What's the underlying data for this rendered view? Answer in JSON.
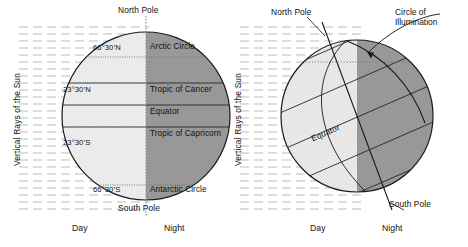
{
  "figure": {
    "colors": {
      "day_fill": "#ececec",
      "day_fill_alt": "#f2f2f2",
      "night_fill": "#9a9a9a",
      "night_fill_dark": "#8e8e8e",
      "outline": "#1a1a1a",
      "ray_dash": "#b9b9b9",
      "dotted_axis": "#8f8f8f",
      "text": "#111111"
    }
  },
  "left_panel": {
    "name": "equinox-globe",
    "axis_label": "Vertical Rays of the Sun",
    "pole_top": "North Pole",
    "pole_bottom": "South Pole",
    "latitude_left_labels": [
      {
        "text": "66°30’N",
        "lat": 66.5
      },
      {
        "text": "23°30’N",
        "lat": 23.5
      },
      {
        "text": "23°30’S",
        "lat": -23.5
      },
      {
        "text": "66°30’S",
        "lat": -66.5
      }
    ],
    "latitude_right_labels": [
      {
        "text": "Arctic Circle",
        "lat": 66.5
      },
      {
        "text": "Tropic of Cancer",
        "lat": 23.5
      },
      {
        "text": "Equator",
        "lat": 0
      },
      {
        "text": "Tropic of Capricorn",
        "lat": -23.5
      },
      {
        "text": "Antarctic Circle",
        "lat": -66.5
      }
    ],
    "bottom_left": "Day",
    "bottom_right": "Night"
  },
  "right_panel": {
    "name": "solstice-globe",
    "axis_label": "Vertical Rays of the Sun",
    "pole_top": "North Pole",
    "pole_bottom": "South Pole",
    "equator_label": "Equator",
    "circle_of_illumination": "Circle of\nIllumination",
    "circle_of_illumination_line1": "Circle of",
    "circle_of_illumination_line2": "Illumination",
    "bottom_left": "Day",
    "bottom_right": "Night",
    "axis_tilt_degrees": 23.5
  }
}
